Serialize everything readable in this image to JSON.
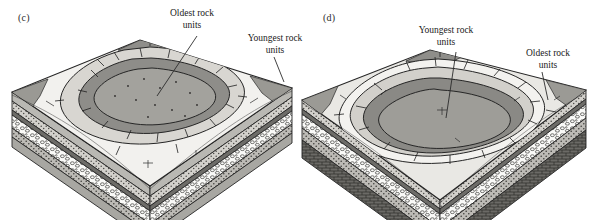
{
  "figure": {
    "background": "#ffffff",
    "width": 600,
    "height": 220
  },
  "panels": [
    {
      "id": "c",
      "tag": "(c)",
      "structure": "eroded dome",
      "description": "Block diagram of an eroded dome: strata arch upward and erosion exposes concentric outcrop bands with the oldest rock units in the center.",
      "labels": [
        {
          "name": "oldest-rock-units",
          "text": "Oldest rock\nunits",
          "points_to": "central eroded core of the dome"
        },
        {
          "name": "youngest-rock-units",
          "text": "Youngest rock\nunits",
          "points_to": "outermost ring at the edge of the block"
        }
      ],
      "surface_rings": [
        {
          "name": "outer-ring",
          "age": "youngest",
          "fill": "#f2f1ee"
        },
        {
          "name": "middle-ring",
          "age": "intermediate",
          "fill": "#d8d6d1"
        },
        {
          "name": "inner-ring",
          "age": "older",
          "fill": "#8e8d89"
        },
        {
          "name": "core",
          "age": "oldest",
          "fill": "#a3a29d"
        }
      ],
      "cross_section_layers": [
        {
          "name": "upper-shale-layer",
          "pattern": "solid-gray",
          "fill": "#b9b8b3"
        },
        {
          "name": "stippled-sandstone-layer",
          "pattern": "stipple",
          "fill": "#cfcdc8"
        },
        {
          "name": "dark-band-layer",
          "pattern": "solid-dark",
          "fill": "#6d6c68"
        },
        {
          "name": "conglomerate-layer",
          "pattern": "pebbles",
          "fill": "#fbfbfa"
        },
        {
          "name": "lower-stipple-layer",
          "pattern": "stipple",
          "fill": "#c6c4bf"
        },
        {
          "name": "basal-gray-layer",
          "pattern": "solid-gray",
          "fill": "#a8a7a2"
        }
      ]
    },
    {
      "id": "d",
      "tag": "(d)",
      "structure": "eroded basin",
      "description": "Block diagram of an eroded basin: strata dip inward and erosion exposes concentric outcrop bands with the youngest rock units in the center.",
      "labels": [
        {
          "name": "youngest-rock-units",
          "text": "Youngest rock\nunits",
          "points_to": "central eroded core of the basin"
        },
        {
          "name": "oldest-rock-units",
          "text": "Oldest rock\nunits",
          "points_to": "outermost ring at the edge of the block"
        }
      ],
      "surface_rings": [
        {
          "name": "outer-ring",
          "age": "oldest",
          "fill": "#e9e8e4"
        },
        {
          "name": "middle-ring",
          "age": "intermediate",
          "fill": "#cfcdc8"
        },
        {
          "name": "inner-ring",
          "age": "younger",
          "fill": "#8a8985"
        },
        {
          "name": "core",
          "age": "youngest",
          "fill": "#9e9d98"
        }
      ],
      "cross_section_layers": [
        {
          "name": "upper-stipple-layer",
          "pattern": "stipple",
          "fill": "#d4d2cd"
        },
        {
          "name": "dark-band-layer",
          "pattern": "solid-dark",
          "fill": "#6d6c68"
        },
        {
          "name": "conglomerate-layer",
          "pattern": "pebbles",
          "fill": "#fbfbfa"
        },
        {
          "name": "lower-stipple-layer",
          "pattern": "stipple",
          "fill": "#c2c0bb"
        },
        {
          "name": "basement-layer",
          "pattern": "brick-crosshatch",
          "fill": "#5a5955"
        }
      ]
    }
  ],
  "colors": {
    "line": "#262626",
    "text": "#1a1a1a",
    "leader": "#2b2b2b"
  }
}
